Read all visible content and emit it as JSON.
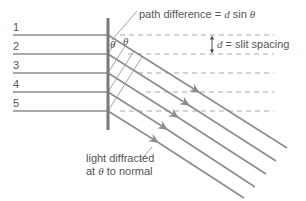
{
  "diagram": {
    "slit_labels": [
      "1",
      "2",
      "3",
      "4",
      "5"
    ],
    "path_difference_label": {
      "prefix": "path difference = ",
      "var_d": "d",
      "mid": " sin ",
      "var_theta": "θ"
    },
    "slit_spacing_label": {
      "var_d": "d",
      "suffix": " = slit spacing"
    },
    "angle_symbol": "θ",
    "diffracted_label": {
      "line1": "light diffracted",
      "line2_prefix": "at ",
      "line2_theta": "θ",
      "line2_suffix": " to normal"
    },
    "colors": {
      "ray": "#8c8c8c",
      "grating": "#7a7a7a",
      "dashed": "#9a9a9a",
      "text": "#555555"
    }
  }
}
